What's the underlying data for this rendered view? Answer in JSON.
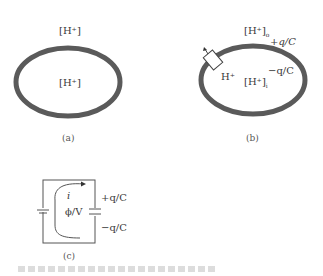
{
  "panels": {
    "a": {
      "outside_label": "[H⁺]",
      "inside_label": "[H⁺]",
      "caption": "(a)"
    },
    "b": {
      "outside_label": "[H⁺]",
      "outside_sub": "o",
      "inside_label": "[H⁺]",
      "inside_sub": "i",
      "pump_label": "H⁺",
      "plus_charge": "+q/C",
      "minus_charge": "−q/C",
      "caption": "(b)"
    },
    "c": {
      "current_label": "i",
      "potential_label": "ϕ/V",
      "plus_charge": "+q/C",
      "minus_charge": "−q/C",
      "caption": "(c)"
    }
  },
  "colors": {
    "membrane": "#5a5a5a",
    "line": "#444444",
    "text": "#3a3a3a"
  }
}
